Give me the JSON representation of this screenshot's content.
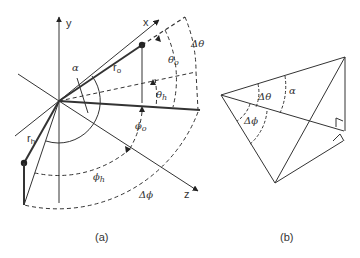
{
  "figure_a": {
    "caption": "(a)",
    "axis_labels": {
      "x": "x",
      "y": "y",
      "z": "z"
    },
    "vector_labels": {
      "r_o": "r",
      "r_o_sub": "o",
      "r_h": "r",
      "r_h_sub": "h"
    },
    "angle_labels": {
      "alpha": "α",
      "theta_o": "θ",
      "theta_o_sub": "o",
      "theta_h": "θ",
      "theta_h_sub": "h",
      "delta_theta": "Δθ",
      "phi_o": "ϕ",
      "phi_o_sub": "o",
      "phi_h": "ϕ",
      "phi_h_sub": "h",
      "delta_phi": "Δϕ"
    }
  },
  "figure_b": {
    "caption": "(b)",
    "angle_labels": {
      "delta_theta": "Δθ",
      "alpha": "α",
      "delta_phi": "Δϕ"
    }
  },
  "colors": {
    "line": "#333333",
    "background": "#ffffff"
  }
}
